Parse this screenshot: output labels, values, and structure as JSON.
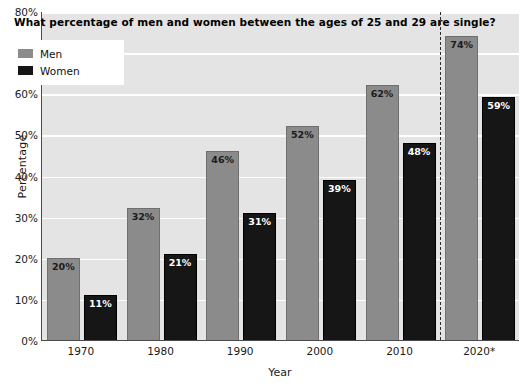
{
  "chart_data": {
    "type": "bar",
    "title": "What percentage of men and women between the ages of 25 and 29 are single?",
    "xlabel": "Year",
    "ylabel": "Percentage",
    "categories": [
      "1970",
      "1980",
      "1990",
      "2000",
      "2010",
      "2020*"
    ],
    "series": [
      {
        "name": "Men",
        "color": "#8b8b8b",
        "values": [
          20,
          32,
          46,
          52,
          62,
          74
        ]
      },
      {
        "name": "Women",
        "color": "#161616",
        "values": [
          11,
          21,
          31,
          39,
          48,
          59
        ]
      }
    ],
    "value_labels": {
      "Men": [
        "20%",
        "32%",
        "46%",
        "52%",
        "62%",
        "74%"
      ],
      "Women": [
        "11%",
        "21%",
        "31%",
        "39%",
        "48%",
        "59%"
      ]
    },
    "ylim": [
      0,
      80
    ],
    "yticks": [
      0,
      10,
      20,
      30,
      40,
      50,
      60,
      70,
      80
    ],
    "ytick_labels": [
      "0%",
      "10%",
      "20%",
      "30%",
      "40%",
      "50%",
      "60%",
      "70%",
      "80%"
    ],
    "grid": "horizontal",
    "legend_position": "top-left",
    "annotations": [
      {
        "name": "projection-divider",
        "type": "vertical-dashed-line",
        "after_category": "2010"
      }
    ],
    "plot_background": "#e4e4e4",
    "gridline_color": "#ffffff",
    "axis_color": "#4a4a4a"
  }
}
